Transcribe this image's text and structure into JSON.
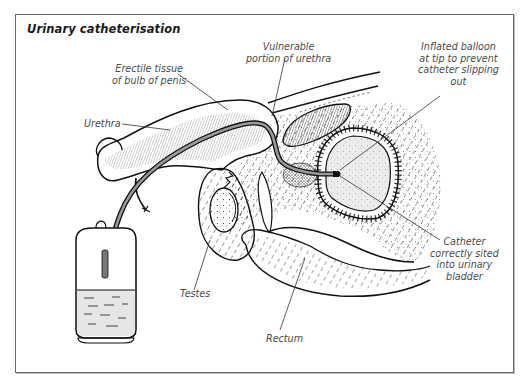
{
  "figure": {
    "title": "Urinary catheterisation",
    "labels": {
      "erectile_tissue": "Erectile tissue\nof bulb of penis",
      "vulnerable": "Vulnerable\nportion of urethra",
      "balloon": "Inflated balloon\nat tip to prevent\ncatheter slipping\nout",
      "urethra": "Urethra",
      "catheter": "Catheter\ncorrectly sited\ninto urinary\nbladder",
      "testes": "Testes",
      "rectum": "Rectum"
    }
  },
  "colors": {
    "line": "#111111",
    "label_text": "#4a4a4a",
    "bladder_fill": "#ececec",
    "fluid_fill": "#e6e6e6",
    "catheter_fill": "#9a9a9a",
    "frame": "#6a6a6a"
  }
}
